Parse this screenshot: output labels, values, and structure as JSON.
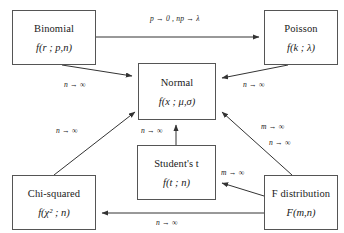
{
  "diagram": {
    "type": "flow-diagram",
    "nodes": [
      {
        "id": "binomial",
        "name": "Binomial",
        "pdf": "f(r ; p,n)",
        "x": 12,
        "y": 10,
        "w": 84,
        "h": 55
      },
      {
        "id": "poisson",
        "name": "Poisson",
        "pdf": "f(k ; λ)",
        "x": 264,
        "y": 10,
        "w": 74,
        "h": 55
      },
      {
        "id": "normal",
        "name": "Normal",
        "pdf": "f(x ; μ,σ)",
        "x": 138,
        "y": 63,
        "w": 78,
        "h": 57
      },
      {
        "id": "students-t",
        "name": "Student's t",
        "pdf": "f(t ; n)",
        "x": 137,
        "y": 145,
        "w": 79,
        "h": 55
      },
      {
        "id": "chi-squared",
        "name": "Chi-squared",
        "pdf": "f(χ² ; n)",
        "x": 12,
        "y": 175,
        "w": 84,
        "h": 55
      },
      {
        "id": "f-dist",
        "name": "F distribution",
        "pdf": "F(m,n)",
        "x": 264,
        "y": 175,
        "w": 74,
        "h": 55
      }
    ],
    "edges": [
      {
        "id": "binomial-to-poisson",
        "from": "binomial",
        "to": "poisson",
        "label": "p → 0 , np → λ",
        "lx": 150,
        "ly": 14
      },
      {
        "id": "binomial-to-normal",
        "from": "binomial",
        "to": "normal",
        "label": "n → ∞",
        "lx": 64,
        "ly": 80
      },
      {
        "id": "poisson-to-normal",
        "from": "poisson",
        "to": "normal",
        "label": "n → ∞",
        "lx": 243,
        "ly": 80
      },
      {
        "id": "chisq-to-normal",
        "from": "chi-squared",
        "to": "normal",
        "label": "n → ∞",
        "lx": 56,
        "ly": 126
      },
      {
        "id": "t-to-normal",
        "from": "students-t",
        "to": "normal",
        "label": "n → ∞",
        "lx": 141,
        "ly": 126
      },
      {
        "id": "f-to-normal-m",
        "from": "f-dist",
        "to": "normal",
        "label": "m → ∞",
        "lx": 261,
        "ly": 122
      },
      {
        "id": "f-to-normal-n",
        "from": "f-dist",
        "to": "normal",
        "label": "n → ∞",
        "lx": 269,
        "ly": 138
      },
      {
        "id": "f-to-t",
        "from": "f-dist",
        "to": "students-t",
        "label": "m → ∞",
        "lx": 221,
        "ly": 168
      },
      {
        "id": "f-to-chisq",
        "from": "f-dist",
        "to": "chi-squared",
        "label": "n → ∞",
        "lx": 156,
        "ly": 218
      }
    ],
    "colors": {
      "box_border": "#555555",
      "arrow": "#333333",
      "text": "#1a1a1a",
      "background": "#ffffff"
    }
  }
}
